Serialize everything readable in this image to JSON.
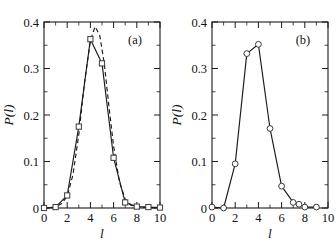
{
  "figure": {
    "background": "#ffffff",
    "ink_color": "#1a1a1a",
    "panels": [
      "a",
      "b"
    ]
  },
  "axis": {
    "x_label": "l",
    "y_label": "P(l)",
    "x_ticklabels": [
      "0",
      "2",
      "4",
      "6",
      "8",
      "10"
    ],
    "y_ticklabels": [
      "0",
      "0.1",
      "0.2",
      "0.3",
      "0.4"
    ],
    "x_tick_values": [
      0,
      2,
      4,
      6,
      8,
      10
    ],
    "y_tick_values": [
      0,
      0.1,
      0.2,
      0.3,
      0.4
    ],
    "x_minor_step": 1,
    "y_minor_step": 0.05
  },
  "panel_a": {
    "tag": "(a)"
  },
  "panel_b": {
    "tag": "(b)"
  },
  "chart_data": [
    {
      "type": "line",
      "panel": "a",
      "title": "(a)",
      "xlabel": "l",
      "ylabel": "P(l)",
      "xlim": [
        0,
        10
      ],
      "ylim": [
        0,
        0.4
      ],
      "grid": false,
      "legend": "none",
      "series": [
        {
          "name": "measured distribution",
          "style": "solid-line-with-open-square-markers",
          "marker": "square",
          "linestyle": "solid",
          "x": [
            0,
            1,
            2,
            3,
            4,
            5,
            6,
            7,
            8,
            9,
            10
          ],
          "values": [
            0.0,
            0.002,
            0.027,
            0.175,
            0.363,
            0.311,
            0.108,
            0.012,
            0.003,
            0.002,
            0.001
          ]
        },
        {
          "name": "fit",
          "style": "dashed-line-no-markers",
          "marker": "none",
          "linestyle": "dashed",
          "x": [
            0.6,
            1.0,
            1.5,
            2.0,
            2.5,
            3.0,
            3.5,
            4.0,
            4.4,
            4.8,
            5.2,
            5.6,
            6.0,
            6.5,
            7.0,
            7.5,
            8.0,
            9.0,
            10.0
          ],
          "values": [
            0.0,
            0.003,
            0.009,
            0.025,
            0.072,
            0.158,
            0.272,
            0.36,
            0.39,
            0.372,
            0.31,
            0.218,
            0.133,
            0.056,
            0.019,
            0.006,
            0.002,
            0.001,
            0.0
          ]
        }
      ]
    },
    {
      "type": "line",
      "panel": "b",
      "title": "(b)",
      "xlabel": "l",
      "ylabel": "P(l)",
      "xlim": [
        0,
        10
      ],
      "ylim": [
        0,
        0.4
      ],
      "grid": false,
      "legend": "none",
      "series": [
        {
          "name": "measured distribution",
          "style": "solid-line-with-open-circle-markers",
          "marker": "circle",
          "linestyle": "solid",
          "x": [
            0,
            1,
            2,
            3,
            4,
            5,
            6,
            7,
            7.5,
            8,
            9
          ],
          "values": [
            0.002,
            0.0,
            0.095,
            0.332,
            0.352,
            0.171,
            0.047,
            0.012,
            0.008,
            0.002,
            0.002
          ]
        }
      ]
    }
  ]
}
